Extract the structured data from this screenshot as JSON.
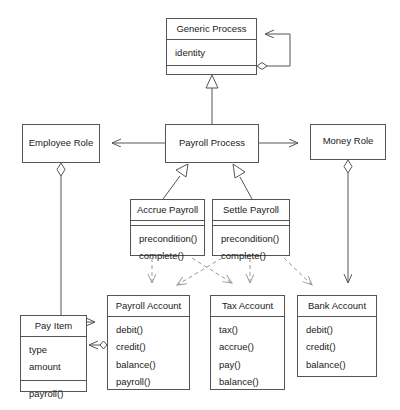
{
  "diagram": {
    "type": "uml-class-diagram",
    "canvas": {
      "width": 400,
      "height": 410,
      "background": "#ffffff"
    },
    "line_color": "#555555",
    "text_color": "#1a1a1a",
    "classes": [
      {
        "id": "generic-process",
        "name": "Generic Process",
        "attributes": [
          "identity"
        ],
        "operations": [],
        "has_empty_compartment": true
      },
      {
        "id": "employee-role",
        "name": "Employee Role",
        "attributes": [],
        "operations": [],
        "has_empty_compartment": false
      },
      {
        "id": "payroll-process",
        "name": "Payroll Process",
        "attributes": [],
        "operations": [],
        "has_empty_compartment": false
      },
      {
        "id": "money-role",
        "name": "Money Role",
        "attributes": [],
        "operations": [],
        "has_empty_compartment": false
      },
      {
        "id": "accrue-payroll",
        "name": "Accrue Payroll",
        "attributes": [],
        "operations": [
          "precondition()",
          "complete()"
        ],
        "has_empty_compartment": true
      },
      {
        "id": "settle-payroll",
        "name": "Settle Payroll",
        "attributes": [],
        "operations": [
          "precondition()",
          "complete()"
        ],
        "has_empty_compartment": true
      },
      {
        "id": "pay-item",
        "name": "Pay Item",
        "attributes": [
          "type",
          "amount"
        ],
        "operations": [
          "payroll()"
        ],
        "has_empty_compartment": false
      },
      {
        "id": "payroll-account",
        "name": "Payroll Account",
        "attributes": [],
        "operations": [
          "debit()",
          "credit()",
          "balance()",
          "payroll()"
        ],
        "has_empty_compartment": false
      },
      {
        "id": "tax-account",
        "name": "Tax Account",
        "attributes": [],
        "operations": [
          "tax()",
          "accrue()",
          "pay()",
          "balance()"
        ],
        "has_empty_compartment": false
      },
      {
        "id": "bank-account",
        "name": "Bank Account",
        "attributes": [],
        "operations": [
          "debit()",
          "credit()",
          "balance()"
        ],
        "has_empty_compartment": false
      }
    ],
    "relationships": [
      {
        "kind": "aggregation-self",
        "from": "generic-process",
        "to": "generic-process"
      },
      {
        "kind": "generalization",
        "from": "payroll-process",
        "to": "generic-process"
      },
      {
        "kind": "association",
        "from": "payroll-process",
        "to": "employee-role"
      },
      {
        "kind": "association",
        "from": "payroll-process",
        "to": "money-role"
      },
      {
        "kind": "generalization",
        "from": "accrue-payroll",
        "to": "payroll-process"
      },
      {
        "kind": "generalization",
        "from": "settle-payroll",
        "to": "payroll-process"
      },
      {
        "kind": "aggregation",
        "from": "employee-role",
        "to": "payroll-account"
      },
      {
        "kind": "aggregation",
        "from": "money-role",
        "to": "bank-account"
      },
      {
        "kind": "aggregation",
        "from": "payroll-account",
        "to": "pay-item"
      },
      {
        "kind": "dependency",
        "from": "accrue-payroll",
        "to": "payroll-account"
      },
      {
        "kind": "dependency",
        "from": "accrue-payroll",
        "to": "tax-account"
      },
      {
        "kind": "dependency",
        "from": "settle-payroll",
        "to": "payroll-account"
      },
      {
        "kind": "dependency",
        "from": "settle-payroll",
        "to": "tax-account"
      },
      {
        "kind": "dependency",
        "from": "settle-payroll",
        "to": "bank-account"
      }
    ]
  }
}
